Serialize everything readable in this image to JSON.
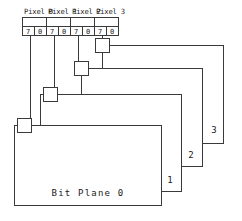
{
  "diagram": {
    "line_color": "#3a3a3a",
    "text_color": "#1a1a1a",
    "background": "#ffffff",
    "pixel_labels": [
      {
        "text": "Pixel 0"
      },
      {
        "text": "Pixel 1"
      },
      {
        "text": "Pixel 2"
      },
      {
        "text": "Pixel 3"
      }
    ],
    "bit_digits": [
      {
        "text": "7"
      },
      {
        "text": "0"
      },
      {
        "text": "7"
      },
      {
        "text": "0"
      },
      {
        "text": "7"
      },
      {
        "text": "0"
      },
      {
        "text": "7"
      },
      {
        "text": "0"
      }
    ],
    "planes": [
      {
        "label": "Bit Plane 0"
      },
      {
        "label": "1"
      },
      {
        "label": "2"
      },
      {
        "label": "3"
      }
    ]
  }
}
